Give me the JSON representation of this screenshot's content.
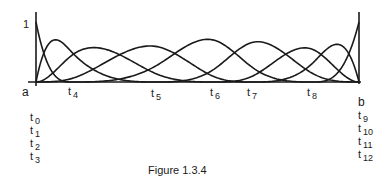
{
  "figure": {
    "caption": "Figure 1.3.4",
    "y_tick_label": "1",
    "left_endpoint_label": "a",
    "right_endpoint_label": "b"
  },
  "chart_data": {
    "type": "line",
    "title": "Figure 1.3.4",
    "degree": 3,
    "knot_labels": [
      "t0",
      "t1",
      "t2",
      "t3",
      "t4",
      "t5",
      "t6",
      "t7",
      "t8",
      "t9",
      "t10",
      "t11",
      "t12"
    ],
    "knot_pixel_x": [
      36,
      36,
      36,
      36,
      72,
      157,
      215,
      253,
      313,
      359,
      359,
      359,
      359
    ],
    "ylim": [
      0,
      1
    ],
    "yticks": [
      1
    ],
    "baseline_px": 82,
    "unit_height_px": 60,
    "axis_top_px": 12,
    "num_basis_functions": 9
  },
  "labels": {
    "interior": [
      {
        "base": "t",
        "sub": "4",
        "x": 68,
        "y": 86
      },
      {
        "base": "t",
        "sub": "5",
        "x": 151,
        "y": 88
      },
      {
        "base": "t",
        "sub": "6",
        "x": 210,
        "y": 87
      },
      {
        "base": "t",
        "sub": "7",
        "x": 247,
        "y": 87
      },
      {
        "base": "t",
        "sub": "8",
        "x": 307,
        "y": 87
      }
    ],
    "left_stack": [
      {
        "base": "t",
        "sub": "0",
        "x": 30,
        "y": 112
      },
      {
        "base": "t",
        "sub": "1",
        "x": 30,
        "y": 125
      },
      {
        "base": "t",
        "sub": "2",
        "x": 30,
        "y": 138
      },
      {
        "base": "t",
        "sub": "3",
        "x": 30,
        "y": 151
      }
    ],
    "right_stack": [
      {
        "base": "t",
        "sub": "9",
        "x": 358,
        "y": 110
      },
      {
        "base": "t",
        "sub": "10",
        "x": 358,
        "y": 123
      },
      {
        "base": "t",
        "sub": "11",
        "x": 358,
        "y": 136
      },
      {
        "base": "t",
        "sub": "12",
        "x": 358,
        "y": 149
      }
    ]
  }
}
